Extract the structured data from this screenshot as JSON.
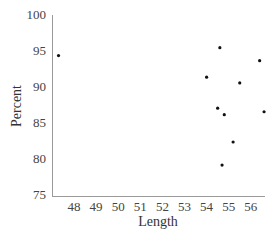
{
  "chart_data": {
    "type": "scatter",
    "title": "",
    "xlabel": "Length",
    "ylabel": "Percent",
    "xlim": [
      47.0,
      56.7
    ],
    "ylim": [
      75,
      100
    ],
    "x_ticks": [
      48,
      49,
      50,
      51,
      52,
      53,
      54,
      55,
      56
    ],
    "y_ticks": [
      75,
      80,
      85,
      90,
      95,
      100
    ],
    "grid": false,
    "legend": null,
    "series": [
      {
        "name": "data",
        "color": "#111111",
        "points": [
          {
            "x": 47.3,
            "y": 94.5
          },
          {
            "x": 54.6,
            "y": 95.6
          },
          {
            "x": 56.4,
            "y": 93.8
          },
          {
            "x": 54.0,
            "y": 91.5
          },
          {
            "x": 55.5,
            "y": 90.7
          },
          {
            "x": 54.5,
            "y": 87.2
          },
          {
            "x": 54.8,
            "y": 86.3
          },
          {
            "x": 56.6,
            "y": 86.7
          },
          {
            "x": 55.2,
            "y": 82.5
          },
          {
            "x": 54.7,
            "y": 79.3
          }
        ]
      }
    ]
  },
  "layout": {
    "plot_left": 52,
    "plot_right": 265,
    "plot_top": 16,
    "plot_bottom": 196,
    "x_origin_value": 48,
    "x_origin_px": 74,
    "x_px_per_unit": 22.1,
    "y_px_per_unit": 7.2
  }
}
